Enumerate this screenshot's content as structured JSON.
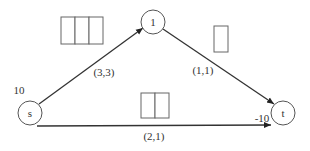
{
  "diagram": {
    "type": "flow-network",
    "nodes": [
      {
        "id": "s",
        "label": "s",
        "supply": "10"
      },
      {
        "id": "1",
        "label": "1"
      },
      {
        "id": "t",
        "label": "t",
        "supply": "-10"
      }
    ],
    "edges": [
      {
        "from": "s",
        "to": "1",
        "label": "(3,3)",
        "boxes": 3
      },
      {
        "from": "1",
        "to": "t",
        "label": "(1,1)",
        "boxes": 1
      },
      {
        "from": "s",
        "to": "t",
        "label": "(2,1)",
        "boxes": 2
      }
    ],
    "colors": {
      "stroke": "#333333",
      "node_stroke": "#555555",
      "box_stroke": "#666666",
      "background": "#ffffff"
    }
  }
}
